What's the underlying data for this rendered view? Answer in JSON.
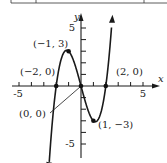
{
  "chart_data": {
    "type": "line",
    "title": "",
    "function": "y = x^3 - 4x",
    "xlabel": "x",
    "ylabel": "y",
    "xlim": [
      -5.5,
      6
    ],
    "ylim": [
      -6,
      6.2
    ],
    "x_ticks": [
      -5,
      -4,
      -3,
      -2,
      -1,
      1,
      2,
      3,
      4,
      5
    ],
    "y_ticks": [
      -5,
      -4,
      -3,
      -2,
      -1,
      1,
      2,
      3,
      4,
      5
    ],
    "x_tick_labels": [
      "-5",
      "5"
    ],
    "y_tick_labels": [
      "5",
      "-5"
    ],
    "grid": false,
    "series": [
      {
        "name": "curve",
        "x": [
          -2.55,
          -2.5,
          -2.25,
          -2,
          -1.75,
          -1.5,
          -1.25,
          -1,
          -0.75,
          -0.5,
          -0.25,
          0,
          0.25,
          0.5,
          0.75,
          1,
          1.25,
          1.5,
          1.75,
          2,
          2.25,
          2.5,
          2.6
        ],
        "y": [
          -6.38,
          -5.63,
          -2.39,
          0,
          1.64,
          2.63,
          3.05,
          3,
          2.58,
          1.88,
          0.98,
          0,
          -0.98,
          -1.88,
          -2.58,
          -3,
          -3.05,
          -2.63,
          -1.64,
          0,
          2.39,
          5.63,
          7.18
        ]
      }
    ],
    "annotations": [
      {
        "label": "(−1, 3)",
        "x": -1,
        "y": 3
      },
      {
        "label": "(−2, 0)",
        "x": -2,
        "y": 0
      },
      {
        "label": "(2, 0)",
        "x": 2,
        "y": 0
      },
      {
        "label": "(0, 0)",
        "x": 0,
        "y": 0
      },
      {
        "label": "(1, −3)",
        "x": 1,
        "y": -3
      }
    ],
    "colors": {
      "curve": "#1a1a1a",
      "axes": "#1a1a1a",
      "points": "#111111"
    }
  }
}
